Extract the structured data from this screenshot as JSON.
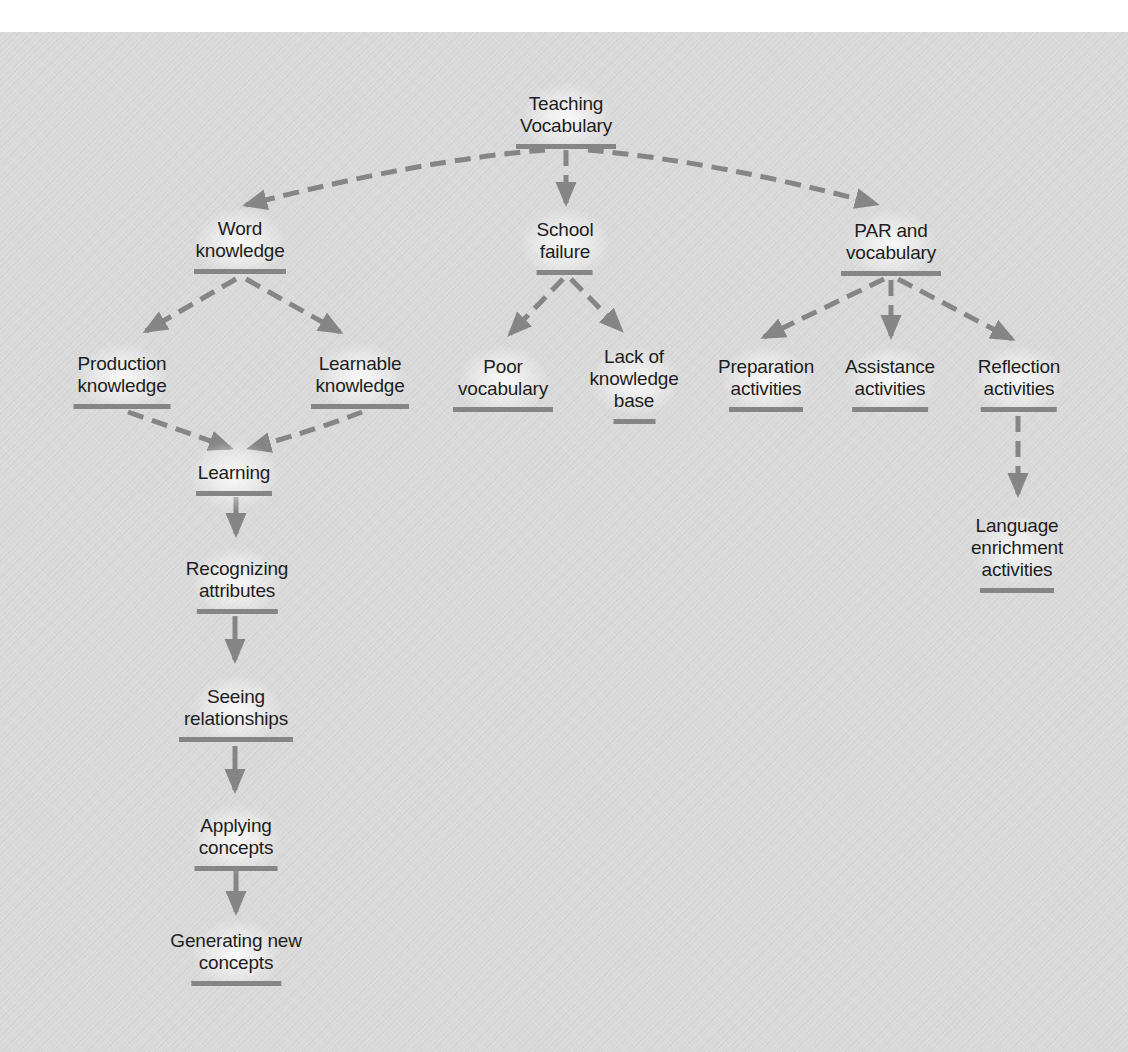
{
  "diagram": {
    "title": "Teaching Vocabulary",
    "colors": {
      "background": "#d9d9d9",
      "top_strip": "#ffffff",
      "text": "#1e1e1e",
      "connector": "#858585"
    },
    "nodes": {
      "root": {
        "label": "Teaching\nVocabulary"
      },
      "word_knowledge": {
        "label": "Word\nknowledge"
      },
      "school_failure": {
        "label": "School\nfailure"
      },
      "par_vocabulary": {
        "label": "PAR and\nvocabulary"
      },
      "production_knowledge": {
        "label": "Production\nknowledge"
      },
      "learnable_knowledge": {
        "label": "Learnable\nknowledge"
      },
      "poor_vocabulary": {
        "label": "Poor\nvocabulary"
      },
      "lack_knowledge_base": {
        "label": "Lack of\nknowledge\nbase"
      },
      "preparation_activities": {
        "label": "Preparation\nactivities"
      },
      "assistance_activities": {
        "label": "Assistance\nactivities"
      },
      "reflection_activities": {
        "label": "Reflection\nactivities"
      },
      "learning": {
        "label": "Learning"
      },
      "language_enrichment": {
        "label": "Language\nenrichment\nactivities"
      },
      "recognizing_attributes": {
        "label": "Recognizing\nattributes"
      },
      "seeing_relationships": {
        "label": "Seeing\nrelationships"
      },
      "applying_concepts": {
        "label": "Applying\nconcepts"
      },
      "generating_new_concepts": {
        "label": "Generating new\nconcepts"
      }
    },
    "edges": [
      {
        "from": "Teaching Vocabulary",
        "to": "Word knowledge",
        "style": "dashed"
      },
      {
        "from": "Teaching Vocabulary",
        "to": "School failure",
        "style": "dashed"
      },
      {
        "from": "Teaching Vocabulary",
        "to": "PAR and vocabulary",
        "style": "dashed"
      },
      {
        "from": "Word knowledge",
        "to": "Production knowledge",
        "style": "dashed"
      },
      {
        "from": "Word knowledge",
        "to": "Learnable knowledge",
        "style": "dashed"
      },
      {
        "from": "School failure",
        "to": "Poor vocabulary",
        "style": "dashed"
      },
      {
        "from": "School failure",
        "to": "Lack of knowledge base",
        "style": "dashed"
      },
      {
        "from": "PAR and vocabulary",
        "to": "Preparation activities",
        "style": "dashed"
      },
      {
        "from": "PAR and vocabulary",
        "to": "Assistance activities",
        "style": "dashed"
      },
      {
        "from": "PAR and vocabulary",
        "to": "Reflection activities",
        "style": "dashed"
      },
      {
        "from": "Production knowledge",
        "to": "Learning",
        "style": "dashed"
      },
      {
        "from": "Learnable knowledge",
        "to": "Learning",
        "style": "dashed"
      },
      {
        "from": "Reflection activities",
        "to": "Language enrichment activities",
        "style": "dashed"
      },
      {
        "from": "Learning",
        "to": "Recognizing attributes",
        "style": "solid"
      },
      {
        "from": "Recognizing attributes",
        "to": "Seeing relationships",
        "style": "solid"
      },
      {
        "from": "Seeing relationships",
        "to": "Applying concepts",
        "style": "solid"
      },
      {
        "from": "Applying concepts",
        "to": "Generating new concepts",
        "style": "solid"
      }
    ]
  }
}
